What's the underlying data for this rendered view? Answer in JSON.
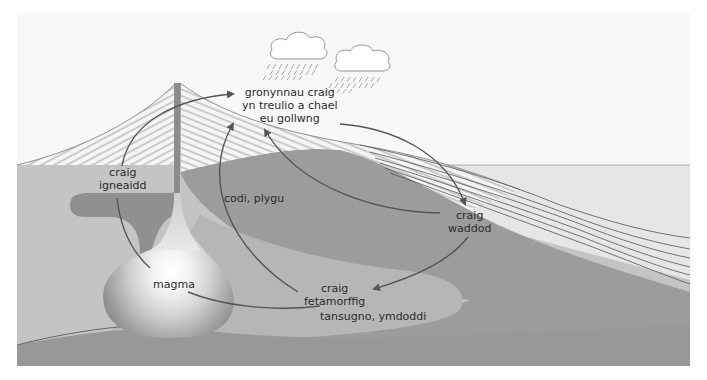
{
  "diagram": {
    "colors": {
      "sky": "#f8f8f8",
      "sea": "#e6e6e6",
      "crust_light": "#c4c4c4",
      "crust_dark": "#999999",
      "metamorphic_zone": "#b4b4b4",
      "magma_chamber": "#8f8f8f",
      "magma_core": "#fafafa",
      "strata_lines": "#555555",
      "arrows": "#555555",
      "text": "#2b2b2b"
    },
    "labels": {
      "weathering": [
        "gronynnau craig",
        "yn treulio a chael",
        "eu gollwng"
      ],
      "igneous": [
        "craig",
        "igneaidd"
      ],
      "uplift": "codi, plygu",
      "sedimentary": [
        "craig",
        "waddod"
      ],
      "metamorphic": [
        "craig",
        "fetamorffig"
      ],
      "subduction": "tansugno, ymdoddi",
      "magma": "magma"
    },
    "icons": [
      "cloud-rain-icon",
      "cloud-rain-icon"
    ],
    "arrows": [
      {
        "from": "igneous",
        "to": "weathering"
      },
      {
        "from": "weathering",
        "to": "sedimentary"
      },
      {
        "from": "sedimentary",
        "to": "weathering"
      },
      {
        "from": "sedimentary",
        "to": "metamorphic"
      },
      {
        "from": "metamorphic",
        "to": "weathering"
      },
      {
        "from": "metamorphic",
        "to": "magma"
      },
      {
        "from": "magma",
        "to": "igneous"
      }
    ]
  }
}
